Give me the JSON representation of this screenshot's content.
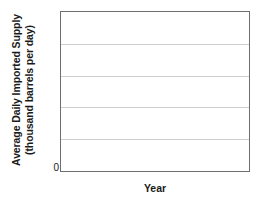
{
  "chart_data": {
    "type": "bar",
    "title": "",
    "subtitle": "",
    "xlabel": "Year",
    "ylabel_line1": "Average Daily Imported Supply",
    "ylabel_line2": "(thousand barrels per day)",
    "ylabel": "Average Daily Imported Supply (thousand barrels per day)",
    "categories": [],
    "values": [],
    "series": [],
    "annotations": [],
    "legend": [],
    "legend_position": "none",
    "grid": true,
    "grid_orientation": "horizontal",
    "gridline_count": 4,
    "ytick_labels": [
      "0"
    ],
    "xtick_labels": [],
    "ylim": [
      0,
      5
    ],
    "note": "empty plot template with no plotted data"
  },
  "axes": {
    "y_title_line1": "Average Daily Imported Supply",
    "y_title_line2": "(thousand barrels per day)",
    "y_zero_label": "0",
    "x_title": "Year"
  },
  "colors": {
    "frame": "#6e6e6e",
    "gridline": "#cfcfcf",
    "text": "#1a1a1a",
    "background": "#ffffff"
  }
}
